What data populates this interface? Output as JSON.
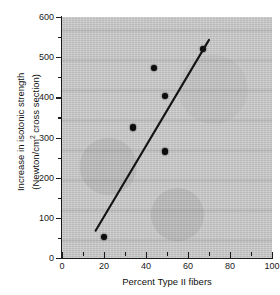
{
  "chart_data": {
    "type": "scatter",
    "title": "",
    "xlabel": "Percent Type II fibers",
    "ylabel_line1": "Increase in isotonic strength",
    "ylabel_line2_prefix": "(Newton/cm",
    "ylabel_line2_sup": "2",
    "ylabel_line2_suffix": " cross section)",
    "xlim": [
      0,
      100
    ],
    "ylim": [
      0,
      600
    ],
    "grid": false,
    "legend": null,
    "x_major_ticks": [
      0,
      20,
      40,
      60,
      80,
      100
    ],
    "x_minor_ticks": [
      10,
      30,
      50,
      70,
      90
    ],
    "x_tick_labels": [
      "0",
      "20",
      "40",
      "60",
      "80",
      "100"
    ],
    "y_major_ticks": [
      0,
      100,
      200,
      300,
      400,
      500,
      600
    ],
    "y_minor_ticks": [
      50,
      150,
      250,
      350,
      450,
      550
    ],
    "y_tick_labels": [
      "0",
      "100",
      "200",
      "300",
      "400",
      "500",
      "600"
    ],
    "points": [
      {
        "x": 20,
        "y": 53
      },
      {
        "x": 34,
        "y": 325
      },
      {
        "x": 44,
        "y": 473
      },
      {
        "x": 49,
        "y": 403
      },
      {
        "x": 49,
        "y": 265
      },
      {
        "x": 67,
        "y": 520
      }
    ],
    "trend_line": {
      "type": "regression-line",
      "x_start": 16,
      "y_start": 68,
      "x_end": 70,
      "y_end": 543
    },
    "colors": {
      "point": "#0d0d0d",
      "line": "#141414",
      "axis": "#1a1a1a",
      "panel_background": "#c9c9c9",
      "figure_background": "#ffffff"
    }
  }
}
